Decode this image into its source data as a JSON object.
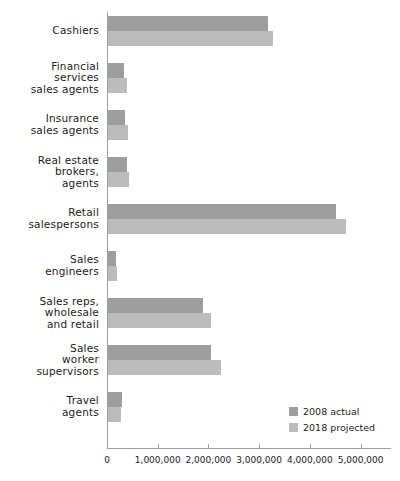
{
  "chart_data": {
    "type": "bar",
    "orientation": "horizontal",
    "title": "",
    "xlabel": "",
    "ylabel": "",
    "xlim": [
      0,
      5600000
    ],
    "xticks": [
      0,
      1000000,
      2000000,
      3000000,
      4000000,
      5000000
    ],
    "xtick_labels": [
      "0",
      "1,000,000",
      "2,000,000",
      "3,000,000",
      "4,000,000",
      "5,000,000"
    ],
    "grid": false,
    "legend_position": "lower-right",
    "categories": [
      "Cashiers",
      "Financial services sales agents",
      "Insurance sales agents",
      "Real estate brokers, agents",
      "Retail salespersons",
      "Sales engineers",
      "Sales reps, wholesale and retail",
      "Sales worker supervisors",
      "Travel agents"
    ],
    "category_lines": [
      [
        "Cashiers"
      ],
      [
        "Financial",
        "services",
        "sales agents"
      ],
      [
        "Insurance",
        "sales agents"
      ],
      [
        "Real estate",
        "brokers,",
        "agents"
      ],
      [
        "Retail",
        "salespersons"
      ],
      [
        "Sales",
        "engineers"
      ],
      [
        "Sales reps,",
        "wholesale",
        "and retail"
      ],
      [
        "Sales",
        "worker",
        "supervisors"
      ],
      [
        "Travel",
        "agents"
      ]
    ],
    "series": [
      {
        "name": "2008 actual",
        "color": "#9d9d9d",
        "values": [
          3150000,
          320000,
          340000,
          380000,
          4490000,
          150000,
          1870000,
          2030000,
          280000
        ]
      },
      {
        "name": "2018 projected",
        "color": "#bcbcbc",
        "values": [
          3250000,
          380000,
          400000,
          420000,
          4700000,
          170000,
          2040000,
          2220000,
          250000
        ]
      }
    ]
  },
  "legend": {
    "items": [
      {
        "label": "2008 actual",
        "color": "#9d9d9d"
      },
      {
        "label": "2018 projected",
        "color": "#bcbcbc"
      }
    ]
  }
}
